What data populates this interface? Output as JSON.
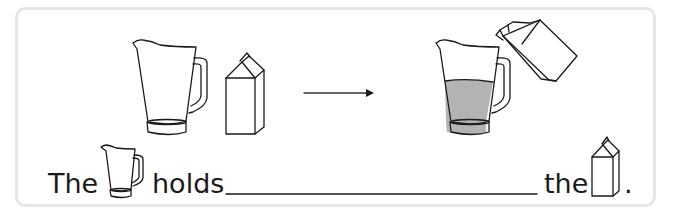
{
  "illustration": {
    "before": [
      "empty-jug",
      "milk-carton"
    ],
    "after": [
      "jug-partly-filled",
      "carton-pouring"
    ],
    "fill_color": "#b3b3b3",
    "arrow": "right-arrow"
  },
  "sentence": {
    "word1": "The",
    "word2": "holds",
    "blank": "",
    "word3": "the",
    "end": "."
  }
}
